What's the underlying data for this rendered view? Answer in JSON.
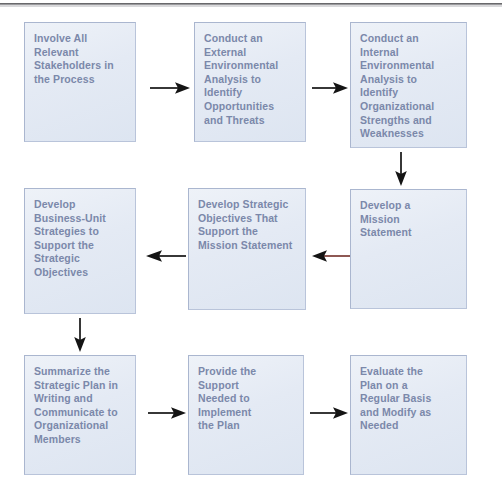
{
  "diagram": {
    "background_color": "#ffffff",
    "node_fill_color": "#e6ecf5",
    "node_border_color": "#b9c4da",
    "node_text_color": "#7b88aa",
    "shadow_color": "#141414",
    "arrow_color": "#141414",
    "accent_arrow_color": "#7a3a34"
  },
  "nodes": [
    {
      "id": "node-involve-stakeholders",
      "name": "involve-all-relevant-stakeholders",
      "text": "Involve All\nRelevant\nStakeholders in\nthe Process",
      "row": 1,
      "column": 1
    },
    {
      "id": "node-external-analysis",
      "name": "conduct-external-environmental-analysis",
      "text": "Conduct an\nExternal\nEnvironmental\nAnalysis to\nIdentify\nOpportunities\nand Threats",
      "row": 1,
      "column": 2
    },
    {
      "id": "node-internal-analysis",
      "name": "conduct-internal-environmental-analysis",
      "text": "Conduct an\nInternal\nEnvironmental\nAnalysis to\nIdentify\nOrganizational\nStrengths and\nWeaknesses",
      "row": 1,
      "column": 3
    },
    {
      "id": "node-business-unit-strategies",
      "name": "develop-business-unit-strategies",
      "text": "Develop\nBusiness-Unit\nStrategies to\nSupport the\nStrategic\nObjectives",
      "row": 2,
      "column": 1
    },
    {
      "id": "node-strategic-objectives",
      "name": "develop-strategic-objectives",
      "text": "Develop Strategic\nObjectives That\nSupport the\nMission Statement",
      "row": 2,
      "column": 2
    },
    {
      "id": "node-mission-statement",
      "name": "develop-mission-statement",
      "text": "Develop a\nMission\nStatement",
      "row": 2,
      "column": 3
    },
    {
      "id": "node-summarize-plan",
      "name": "summarize-strategic-plan",
      "text": "Summarize the\nStrategic Plan in\nWriting and\nCommunicate to\nOrganizational\nMembers",
      "row": 3,
      "column": 1
    },
    {
      "id": "node-provide-support",
      "name": "provide-support-to-implement-plan",
      "text": "Provide the\nSupport\nNeeded to\nImplement\nthe Plan",
      "row": 3,
      "column": 2
    },
    {
      "id": "node-evaluate-plan",
      "name": "evaluate-plan-regularly",
      "text": "Evaluate the\nPlan on a\nRegular Basis\nand Modify as\nNeeded",
      "row": 3,
      "column": 3
    }
  ],
  "connectors": [
    {
      "id": "arrow-r1c1-to-r1c2",
      "name": "arrow-stakeholders-to-external-analysis",
      "direction": "right",
      "color": "#141414"
    },
    {
      "id": "arrow-r1c2-to-r1c3",
      "name": "arrow-external-to-internal-analysis",
      "direction": "right",
      "color": "#141414"
    },
    {
      "id": "arrow-r1c3-to-r2c3",
      "name": "arrow-internal-analysis-to-mission-statement",
      "direction": "down",
      "color": "#141414"
    },
    {
      "id": "arrow-r2c3-to-r2c2",
      "name": "arrow-mission-statement-to-strategic-objectives",
      "direction": "left",
      "color": "#7a3a34"
    },
    {
      "id": "arrow-r2c2-to-r2c1",
      "name": "arrow-strategic-objectives-to-business-unit-strategies",
      "direction": "left",
      "color": "#141414"
    },
    {
      "id": "arrow-r2c1-to-r3c1",
      "name": "arrow-business-unit-strategies-to-summarize-plan",
      "direction": "down",
      "color": "#141414"
    },
    {
      "id": "arrow-r3c1-to-r3c2",
      "name": "arrow-summarize-plan-to-provide-support",
      "direction": "right",
      "color": "#141414"
    },
    {
      "id": "arrow-r3c2-to-r3c3",
      "name": "arrow-provide-support-to-evaluate-plan",
      "direction": "right",
      "color": "#141414"
    }
  ]
}
